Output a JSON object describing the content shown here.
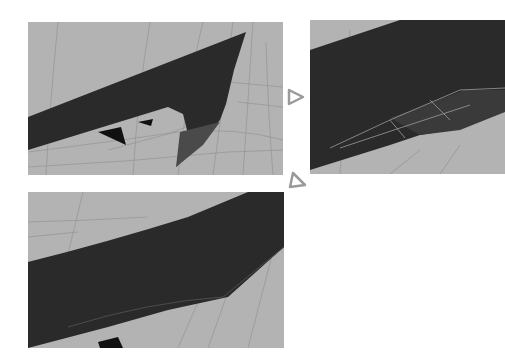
{
  "figure": {
    "panels": [
      {
        "id": "panel-1",
        "description": "Dark wing-shaped mesh over gray grid with curved hook and small spikes"
      },
      {
        "id": "panel-2",
        "description": "Close-up of dark mesh with wireframe highlighted edges"
      },
      {
        "id": "panel-3",
        "description": "Dark curved band mesh over gray grid"
      }
    ],
    "arrows": [
      {
        "icon": "triangle-right-icon",
        "direction": "right"
      },
      {
        "icon": "triangle-upleft-icon",
        "direction": "up-left"
      }
    ],
    "colors": {
      "background": "#ffffff",
      "viewport": "#b3b3b3",
      "mesh": "#2a2a2a",
      "mesh_shade": "#4a4a4a",
      "grid_line": "#8e8e8e",
      "wire": "#9a9a9a",
      "arrow": "#9a9a9a"
    }
  }
}
